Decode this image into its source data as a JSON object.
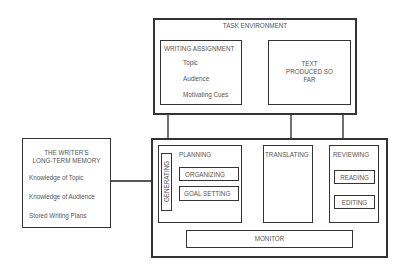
{
  "task_environment": {
    "title": "TASK ENVIRONMENT",
    "writing_assignment": {
      "title": "WRITING ASSIGNMENT",
      "items": [
        "Topic",
        "Audience",
        "Motivating Cues"
      ]
    },
    "text_produced": {
      "line1": "TEXT",
      "line2": "PRODUCED SO",
      "line3": "FAR"
    }
  },
  "long_term_memory": {
    "title_line1": "THE WRITER'S",
    "title_line2": "LONG-TERM MEMORY",
    "items": [
      "Knowledge of Topic",
      "Knowledge of Audience",
      "Stored Writing Plans"
    ]
  },
  "process": {
    "planning": {
      "title": "PLANNING",
      "generating": "GENERATING",
      "organizing": "ORGANIZING",
      "goal_setting": "GOAL SETTING"
    },
    "translating": {
      "title": "TRANSLATING"
    },
    "reviewing": {
      "title": "REVIEWING",
      "reading": "READING",
      "editing": "EDITING"
    },
    "monitor": {
      "title": "MONITOR"
    }
  }
}
